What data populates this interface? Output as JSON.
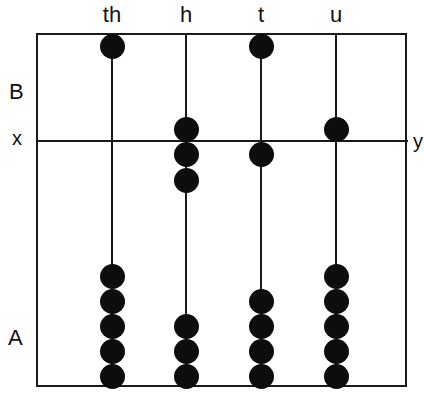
{
  "diagram": {
    "type": "abacus",
    "columns": [
      {
        "label": "th",
        "x": 112,
        "upper_beads": [
          46
        ],
        "lower_beads": [
          276,
          301,
          326,
          351,
          376
        ]
      },
      {
        "label": "h",
        "x": 186,
        "upper_beads": [
          129,
          154,
          180
        ],
        "lower_beads": [
          326,
          351,
          376
        ]
      },
      {
        "label": "t",
        "x": 261,
        "upper_beads": [
          46,
          154
        ],
        "lower_beads": [
          301,
          326,
          351,
          376
        ]
      },
      {
        "label": "u",
        "x": 336,
        "upper_beads": [
          129
        ],
        "lower_beads": [
          276,
          301,
          326,
          351,
          376
        ]
      }
    ],
    "section_labels": {
      "upper": "B",
      "lower": "A"
    },
    "divider_labels": {
      "left": "x",
      "right": "y"
    }
  }
}
